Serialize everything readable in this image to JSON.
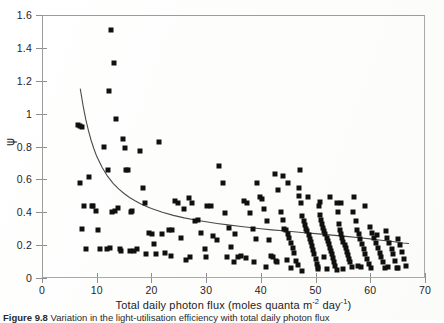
{
  "figure": {
    "caption_label": "Figure 9.8",
    "caption_text": "Variation in the light-utilisation efficiency with total daily photon flux"
  },
  "chart_data": {
    "type": "scatter",
    "title": "",
    "subtitle": "",
    "xlabel_text": "Total daily photon flux (moles quanta m",
    "xlabel_sup1": "-2",
    "xlabel_mid": " day",
    "xlabel_sup2": "-1",
    "xlabel_end": ")",
    "xlabel": "Total daily photon flux (moles quanta m^-2 day^-1)",
    "ylabel": "ψ",
    "xlim": [
      0,
      70
    ],
    "ylim": [
      0,
      1.6
    ],
    "xticks": [
      0,
      10,
      20,
      30,
      40,
      50,
      60,
      70
    ],
    "yticks": [
      0,
      0.2,
      0.4,
      0.6,
      0.8,
      1,
      1.2,
      1.4,
      1.6
    ],
    "xtick_labels": [
      "0",
      "10",
      "20",
      "30",
      "40",
      "50",
      "60",
      "70"
    ],
    "ytick_labels": [
      "0",
      "0.2",
      "0.4",
      "0.6",
      "0.8",
      "1",
      "1.2",
      "1.4",
      "1.6"
    ],
    "grid": false,
    "legend": null,
    "marker": "filled-square",
    "marker_color": "#101010",
    "frame_color": "#a9a9a9",
    "series": [
      {
        "name": "observations",
        "points": [
          [
            6.6,
            0.93
          ],
          [
            7.0,
            0.925
          ],
          [
            7.3,
            0.92
          ],
          [
            6.9,
            0.575
          ],
          [
            7.6,
            0.44
          ],
          [
            7.4,
            0.3
          ],
          [
            8.1,
            0.175
          ],
          [
            8.6,
            0.615
          ],
          [
            9.2,
            0.44
          ],
          [
            9.4,
            0.435
          ],
          [
            9.9,
            0.405
          ],
          [
            10.2,
            0.29
          ],
          [
            10.6,
            0.175
          ],
          [
            11.3,
            0.8
          ],
          [
            11.8,
            0.175
          ],
          [
            12.0,
            0.66
          ],
          [
            12.2,
            1.14
          ],
          [
            12.6,
            1.51
          ],
          [
            12.8,
            0.4
          ],
          [
            13.1,
            1.31
          ],
          [
            13.3,
            0.405
          ],
          [
            13.5,
            0.97
          ],
          [
            13.9,
            0.425
          ],
          [
            14.2,
            0.175
          ],
          [
            14.4,
            0.165
          ],
          [
            14.8,
            0.845
          ],
          [
            15.1,
            0.79
          ],
          [
            15.4,
            0.655
          ],
          [
            15.8,
            0.66
          ],
          [
            16.2,
            0.4
          ],
          [
            16.5,
            0.41
          ],
          [
            16.9,
            0.165
          ],
          [
            17.3,
            0.175
          ],
          [
            18.0,
            0.775
          ],
          [
            18.4,
            0.545
          ],
          [
            18.9,
            0.455
          ],
          [
            19.5,
            0.275
          ],
          [
            20.1,
            0.265
          ],
          [
            20.4,
            0.205
          ],
          [
            20.8,
            0.145
          ],
          [
            21.4,
            0.83
          ],
          [
            21.9,
            0.265
          ],
          [
            22.5,
            0.155
          ],
          [
            23.2,
            0.295
          ],
          [
            23.8,
            0.29
          ],
          [
            24.3,
            0.47
          ],
          [
            24.9,
            0.455
          ],
          [
            25.4,
            0.245
          ],
          [
            26.0,
            0.42
          ],
          [
            26.4,
            0.11
          ],
          [
            26.9,
            0.485
          ],
          [
            27.5,
            0.455
          ],
          [
            28.0,
            0.345
          ],
          [
            28.6,
            0.35
          ],
          [
            29.1,
            0.275
          ],
          [
            29.7,
            0.175
          ],
          [
            30.2,
            0.44
          ],
          [
            30.8,
            0.435
          ],
          [
            31.3,
            0.255
          ],
          [
            31.9,
            0.23
          ],
          [
            32.4,
            0.68
          ],
          [
            33.0,
            0.58
          ],
          [
            33.5,
            0.395
          ],
          [
            34.1,
            0.305
          ],
          [
            34.6,
            0.19
          ],
          [
            35.2,
            0.265
          ],
          [
            35.8,
            0.125
          ],
          [
            36.3,
            0.135
          ],
          [
            36.9,
            0.47
          ],
          [
            37.4,
            0.455
          ],
          [
            38.0,
            0.395
          ],
          [
            38.5,
            0.3
          ],
          [
            39.1,
            0.24
          ],
          [
            39.3,
            0.58
          ],
          [
            39.8,
            0.49
          ],
          [
            40.2,
            0.48
          ],
          [
            40.6,
            0.42
          ],
          [
            41.1,
            0.345
          ],
          [
            41.5,
            0.23
          ],
          [
            41.9,
            0.135
          ],
          [
            42.3,
            0.125
          ],
          [
            42.7,
            0.105
          ],
          [
            43.2,
            0.535
          ],
          [
            43.6,
            0.4
          ],
          [
            44.0,
            0.355
          ],
          [
            44.3,
            0.3
          ],
          [
            44.6,
            0.295
          ],
          [
            44.9,
            0.265
          ],
          [
            45.2,
            0.245
          ],
          [
            45.5,
            0.215
          ],
          [
            45.8,
            0.185
          ],
          [
            46.1,
            0.155
          ],
          [
            46.4,
            0.105
          ],
          [
            46.7,
            0.08
          ],
          [
            47.0,
            0.5
          ],
          [
            47.3,
            0.455
          ],
          [
            47.5,
            0.38
          ],
          [
            47.8,
            0.345
          ],
          [
            48.0,
            0.325
          ],
          [
            48.3,
            0.3
          ],
          [
            48.5,
            0.285
          ],
          [
            48.8,
            0.26
          ],
          [
            49.0,
            0.24
          ],
          [
            49.2,
            0.22
          ],
          [
            49.4,
            0.195
          ],
          [
            49.6,
            0.17
          ],
          [
            49.8,
            0.145
          ],
          [
            50.0,
            0.115
          ],
          [
            50.2,
            0.085
          ],
          [
            50.4,
            0.065
          ],
          [
            50.6,
            0.435
          ],
          [
            50.8,
            0.385
          ],
          [
            51.0,
            0.355
          ],
          [
            51.2,
            0.33
          ],
          [
            51.4,
            0.305
          ],
          [
            51.6,
            0.285
          ],
          [
            51.8,
            0.265
          ],
          [
            52.0,
            0.245
          ],
          [
            52.2,
            0.225
          ],
          [
            52.4,
            0.205
          ],
          [
            52.6,
            0.185
          ],
          [
            52.8,
            0.165
          ],
          [
            53.0,
            0.145
          ],
          [
            53.2,
            0.12
          ],
          [
            53.4,
            0.1
          ],
          [
            53.6,
            0.075
          ],
          [
            53.9,
            0.455
          ],
          [
            54.1,
            0.4
          ],
          [
            54.3,
            0.33
          ],
          [
            54.5,
            0.295
          ],
          [
            54.7,
            0.27
          ],
          [
            54.9,
            0.245
          ],
          [
            55.1,
            0.22
          ],
          [
            55.3,
            0.2
          ],
          [
            55.5,
            0.18
          ],
          [
            55.7,
            0.16
          ],
          [
            55.9,
            0.14
          ],
          [
            56.1,
            0.115
          ],
          [
            56.3,
            0.095
          ],
          [
            56.6,
            0.065
          ],
          [
            44.1,
            0.62
          ],
          [
            45.0,
            0.58
          ],
          [
            46.9,
            0.545
          ],
          [
            48.6,
            0.49
          ],
          [
            50.9,
            0.465
          ],
          [
            52.7,
            0.49
          ],
          [
            54.6,
            0.455
          ],
          [
            42.5,
            0.63
          ],
          [
            47.2,
            0.655
          ],
          [
            51.5,
            0.125
          ],
          [
            56.9,
            0.4
          ],
          [
            57.3,
            0.345
          ],
          [
            57.6,
            0.295
          ],
          [
            57.9,
            0.265
          ],
          [
            58.2,
            0.235
          ],
          [
            58.5,
            0.205
          ],
          [
            58.8,
            0.175
          ],
          [
            59.1,
            0.145
          ],
          [
            59.4,
            0.115
          ],
          [
            59.7,
            0.085
          ],
          [
            60.0,
            0.31
          ],
          [
            60.4,
            0.275
          ],
          [
            60.7,
            0.245
          ],
          [
            61.0,
            0.215
          ],
          [
            61.4,
            0.185
          ],
          [
            61.7,
            0.155
          ],
          [
            62.0,
            0.125
          ],
          [
            62.4,
            0.095
          ],
          [
            62.8,
            0.285
          ],
          [
            63.1,
            0.245
          ],
          [
            63.5,
            0.215
          ],
          [
            63.9,
            0.175
          ],
          [
            64.2,
            0.145
          ],
          [
            64.6,
            0.105
          ],
          [
            65.0,
            0.235
          ],
          [
            65.4,
            0.2
          ],
          [
            65.8,
            0.16
          ],
          [
            66.2,
            0.115
          ],
          [
            66.6,
            0.075
          ],
          [
            57.0,
            0.49
          ],
          [
            59.0,
            0.435
          ],
          [
            61.2,
            0.26
          ],
          [
            63.3,
            0.065
          ],
          [
            65.1,
            0.06
          ],
          [
            58.3,
            0.065
          ],
          [
            55.0,
            0.055
          ],
          [
            50.5,
            0.055
          ],
          [
            47.6,
            0.045
          ],
          [
            44.8,
            0.11
          ],
          [
            41.0,
            0.065
          ],
          [
            37.2,
            0.12
          ],
          [
            33.8,
            0.125
          ],
          [
            30.0,
            0.13
          ],
          [
            27.0,
            0.125
          ],
          [
            23.5,
            0.135
          ],
          [
            19.0,
            0.145
          ],
          [
            16.0,
            0.165
          ],
          [
            12.4,
            0.18
          ],
          [
            43.0,
            0.095
          ],
          [
            45.6,
            0.06
          ],
          [
            52.1,
            0.055
          ],
          [
            54.0,
            0.05
          ],
          [
            57.8,
            0.075
          ],
          [
            60.2,
            0.06
          ],
          [
            62.6,
            0.06
          ],
          [
            64.8,
            0.06
          ],
          [
            38.8,
            0.095
          ],
          [
            35.0,
            0.1
          ]
        ]
      }
    ],
    "fit_curve": {
      "name": "fitted-decay-curve",
      "color": "#4a4a4a",
      "x_start": 7.0,
      "x_end": 67.0,
      "y_start": 1.15,
      "y_end": 0.21,
      "form": "hyperbolic-decay",
      "points": [
        [
          7.0,
          1.15
        ],
        [
          7.5,
          1.05
        ],
        [
          8.0,
          0.965
        ],
        [
          8.5,
          0.895
        ],
        [
          9.0,
          0.835
        ],
        [
          9.5,
          0.785
        ],
        [
          10.0,
          0.74
        ],
        [
          11.0,
          0.672
        ],
        [
          12.0,
          0.618
        ],
        [
          13.0,
          0.576
        ],
        [
          14.0,
          0.542
        ],
        [
          15.0,
          0.514
        ],
        [
          16.0,
          0.49
        ],
        [
          17.0,
          0.47
        ],
        [
          18.0,
          0.452
        ],
        [
          19.0,
          0.437
        ],
        [
          20.0,
          0.423
        ],
        [
          22.0,
          0.4
        ],
        [
          24.0,
          0.381
        ],
        [
          26.0,
          0.366
        ],
        [
          28.0,
          0.353
        ],
        [
          30.0,
          0.342
        ],
        [
          32.0,
          0.332
        ],
        [
          34.0,
          0.323
        ],
        [
          36.0,
          0.315
        ],
        [
          38.0,
          0.307
        ],
        [
          40.0,
          0.3
        ],
        [
          42.0,
          0.293
        ],
        [
          44.0,
          0.287
        ],
        [
          46.0,
          0.281
        ],
        [
          48.0,
          0.275
        ],
        [
          50.0,
          0.27
        ],
        [
          52.0,
          0.264
        ],
        [
          54.0,
          0.258
        ],
        [
          56.0,
          0.252
        ],
        [
          58.0,
          0.245
        ],
        [
          60.0,
          0.238
        ],
        [
          62.0,
          0.23
        ],
        [
          64.0,
          0.222
        ],
        [
          66.0,
          0.213
        ],
        [
          67.0,
          0.21
        ]
      ]
    }
  }
}
